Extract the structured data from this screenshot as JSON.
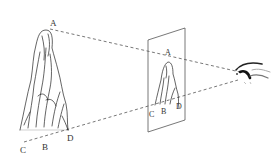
{
  "diagram": {
    "object_labels": {
      "top": "A",
      "bottom_left": "C",
      "bottom_mid": "B",
      "bottom_right": "D"
    },
    "plane_labels": {
      "top": "A",
      "bottom_left": "C",
      "bottom_mid": "B",
      "bottom_right": "D"
    },
    "elements": [
      "mountain-sketch",
      "picture-plane",
      "eye",
      "sight-lines"
    ],
    "colors": {
      "line": "#555555",
      "ink": "#222222",
      "background": "#ffffff"
    }
  }
}
